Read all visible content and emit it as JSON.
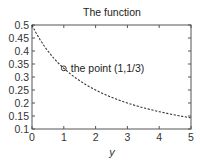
{
  "chart_data": {
    "type": "line",
    "title": "The function",
    "xlabel": "y",
    "ylabel": "",
    "xlim": [
      0,
      5
    ],
    "ylim": [
      0.1,
      0.5
    ],
    "xticks": [
      "0",
      "1",
      "2",
      "3",
      "4",
      "5"
    ],
    "yticks": [
      "0.1",
      "0.15",
      "0.2",
      "0.25",
      "0.3",
      "0.35",
      "0.4",
      "0.45",
      "0.5"
    ],
    "grid": false,
    "series": [
      {
        "name": "f(y) = 1/(2+y)",
        "style": "dashed",
        "x": [
          0,
          0.5,
          1,
          1.5,
          2,
          2.5,
          3,
          3.5,
          4,
          4.5,
          5
        ],
        "values": [
          0.5,
          0.4,
          0.3333,
          0.2857,
          0.25,
          0.2222,
          0.2,
          0.1818,
          0.1667,
          0.1538,
          0.1429
        ]
      }
    ],
    "annotations": [
      {
        "x": 1,
        "y": 0.3333,
        "marker": "circle",
        "text": "the point (1,1/3)"
      }
    ]
  }
}
